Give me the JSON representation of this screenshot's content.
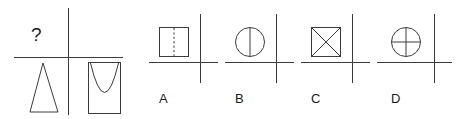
{
  "puzzle": {
    "type": "visual-analogy-multiple-choice",
    "stroke_color": "#3c3c3c",
    "text_color": "#1a1a1a",
    "background_color": "#ffffff",
    "prompt": {
      "question_mark": "?",
      "cell_top_left": "?",
      "cell_top_right_shape": "empty",
      "cell_bottom_left_shape": "triangle-outline",
      "cell_bottom_right_shape": "rectangle-with-inscribed-parabola"
    },
    "options": [
      {
        "label": "A",
        "shape_name": "square-with-vertical-dashed-line",
        "quadrant": "upper-left"
      },
      {
        "label": "B",
        "shape_name": "circle-with-vertical-diameter",
        "quadrant": "upper-left"
      },
      {
        "label": "C",
        "shape_name": "square-with-both-diagonals",
        "quadrant": "upper-left"
      },
      {
        "label": "D",
        "shape_name": "circle-with-vertical-and-horizontal-diameters",
        "quadrant": "upper-left"
      }
    ]
  }
}
